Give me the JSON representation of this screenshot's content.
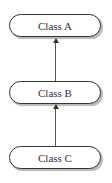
{
  "diagram": {
    "nodes": [
      {
        "id": "A",
        "label": "Class A"
      },
      {
        "id": "B",
        "label": "Class B"
      },
      {
        "id": "C",
        "label": "Class C"
      }
    ],
    "edges": [
      {
        "from": "B",
        "to": "A",
        "type": "arrow"
      },
      {
        "from": "C",
        "to": "B",
        "type": "arrow"
      }
    ]
  }
}
